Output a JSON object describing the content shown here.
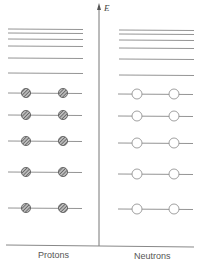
{
  "axis": {
    "label": "E"
  },
  "columns": [
    {
      "name": "protons",
      "label": "Protons",
      "filled": true
    },
    {
      "name": "neutrons",
      "label": "Neutrons",
      "filled": false
    }
  ],
  "levels": {
    "empty_left_y": [
      29,
      33,
      39,
      46,
      58,
      73
    ],
    "empty_right_y": [
      30,
      34,
      40,
      48,
      59,
      75
    ],
    "occupied_left_y": [
      93,
      115,
      141,
      172,
      208
    ],
    "occupied_right_y": [
      94,
      116,
      143,
      174,
      209
    ]
  },
  "colors": {
    "line": "#888888",
    "axis": "#777777",
    "fill": "#666666"
  }
}
